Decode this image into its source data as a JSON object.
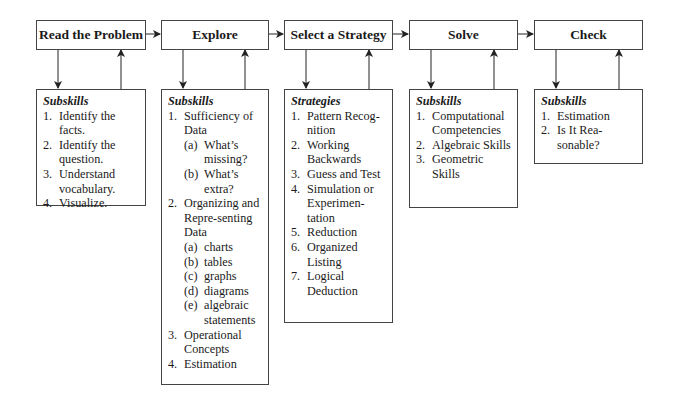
{
  "stages": [
    {
      "title": "Read the Problem"
    },
    {
      "title": "Explore"
    },
    {
      "title": "Select a Strategy"
    },
    {
      "title": "Solve"
    },
    {
      "title": "Check"
    }
  ],
  "details": [
    {
      "heading": "Subskills",
      "items": [
        {
          "num": "1.",
          "text": "Identify the facts."
        },
        {
          "num": "2.",
          "text": "Identify the question."
        },
        {
          "num": "3.",
          "text": "Understand vocabulary."
        },
        {
          "num": "4.",
          "text": "Visualize."
        }
      ]
    },
    {
      "heading": "Subskills",
      "items": [
        {
          "num": "1.",
          "text": "Sufficiency of Data",
          "subs": [
            {
              "lbl": "(a)",
              "text": "What’s missing?"
            },
            {
              "lbl": "(b)",
              "text": "What’s extra?"
            }
          ]
        },
        {
          "num": "2.",
          "text": "Organizing and Repre-senting Data",
          "subs": [
            {
              "lbl": "(a)",
              "text": "charts"
            },
            {
              "lbl": "(b)",
              "text": "tables"
            },
            {
              "lbl": "(c)",
              "text": "graphs"
            },
            {
              "lbl": "(d)",
              "text": "diagrams"
            },
            {
              "lbl": "(e)",
              "text": "algebraic statements"
            }
          ]
        },
        {
          "num": "3.",
          "text": "Operational Concepts"
        },
        {
          "num": "4.",
          "text": "Estimation"
        }
      ]
    },
    {
      "heading": "Strategies",
      "items": [
        {
          "num": "1.",
          "text": "Pattern Recog-nition"
        },
        {
          "num": "2.",
          "text": "Working Backwards"
        },
        {
          "num": "3.",
          "text": "Guess and Test"
        },
        {
          "num": "4.",
          "text": "Simulation or Experimen-tation"
        },
        {
          "num": "5.",
          "text": "Reduction"
        },
        {
          "num": "6.",
          "text": "Organized Listing"
        },
        {
          "num": "7.",
          "text": "Logical Deduction"
        }
      ]
    },
    {
      "heading": "Subskills",
      "items": [
        {
          "num": "1.",
          "text": "Computational Competencies"
        },
        {
          "num": "2.",
          "text": "Algebraic Skills"
        },
        {
          "num": "3.",
          "text": "Geometric Skills"
        }
      ]
    },
    {
      "heading": "Subskills",
      "items": [
        {
          "num": "1.",
          "text": "Estimation"
        },
        {
          "num": "2.",
          "text": "Is It Rea-sonable?"
        }
      ]
    }
  ],
  "colors": {
    "line": "#222222",
    "border": "#444444",
    "text": "#1a1a1a"
  }
}
